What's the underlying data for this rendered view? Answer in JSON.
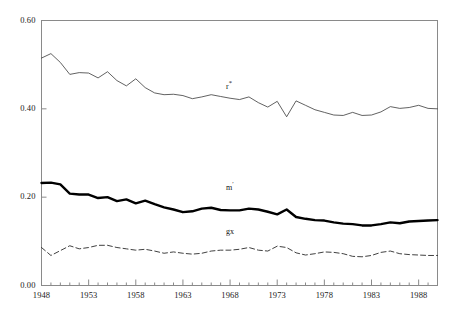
{
  "chart_data": {
    "type": "line",
    "title": "",
    "subtitle": "",
    "xlabel": "",
    "ylabel": "",
    "xlim": [
      1948,
      1990
    ],
    "ylim": [
      0.0,
      0.6
    ],
    "grid": false,
    "legend_position": "inline-annotations",
    "y_ticks": [
      "0.00",
      "0.20",
      "0.40",
      "0.60"
    ],
    "y_tick_values": [
      0.0,
      0.2,
      0.4,
      0.6
    ],
    "x_ticks": [
      "1948",
      "1953",
      "1958",
      "1963",
      "1968",
      "1973",
      "1978",
      "1983",
      "1988"
    ],
    "x_tick_values": [
      1948,
      1953,
      1958,
      1963,
      1968,
      1973,
      1978,
      1983,
      1988
    ],
    "x_minor_tick_interval": 1,
    "x": [
      1948,
      1949,
      1950,
      1951,
      1952,
      1953,
      1954,
      1955,
      1956,
      1957,
      1958,
      1959,
      1960,
      1961,
      1962,
      1963,
      1964,
      1965,
      1966,
      1967,
      1968,
      1969,
      1970,
      1971,
      1972,
      1973,
      1974,
      1975,
      1976,
      1977,
      1978,
      1979,
      1980,
      1981,
      1982,
      1983,
      1984,
      1985,
      1986,
      1987,
      1988,
      1989,
      1990
    ],
    "series": [
      {
        "name": "r*",
        "label": "r",
        "label_sup": "*",
        "style": "solid-thin",
        "color": "#3a3a3a",
        "line_width": 0.8,
        "label_x": 1968,
        "label_y": 0.455,
        "values": [
          0.515,
          0.525,
          0.505,
          0.478,
          0.482,
          0.481,
          0.47,
          0.484,
          0.464,
          0.452,
          0.468,
          0.448,
          0.436,
          0.432,
          0.433,
          0.43,
          0.423,
          0.427,
          0.432,
          0.428,
          0.424,
          0.421,
          0.427,
          0.414,
          0.404,
          0.417,
          0.382,
          0.418,
          0.408,
          0.398,
          0.392,
          0.386,
          0.385,
          0.392,
          0.385,
          0.386,
          0.393,
          0.405,
          0.401,
          0.403,
          0.408,
          0.401,
          0.4
        ]
      },
      {
        "name": "m'",
        "label": "m",
        "label_sup": "′",
        "style": "solid-bold",
        "color": "#000000",
        "line_width": 2.4,
        "label_x": 1968,
        "label_y": 0.225,
        "values": [
          0.232,
          0.233,
          0.229,
          0.208,
          0.206,
          0.206,
          0.198,
          0.2,
          0.191,
          0.195,
          0.186,
          0.192,
          0.184,
          0.177,
          0.172,
          0.166,
          0.168,
          0.174,
          0.176,
          0.171,
          0.17,
          0.17,
          0.174,
          0.172,
          0.167,
          0.161,
          0.172,
          0.155,
          0.151,
          0.148,
          0.147,
          0.143,
          0.14,
          0.139,
          0.136,
          0.136,
          0.139,
          0.143,
          0.141,
          0.145,
          0.146,
          0.147,
          0.148
        ]
      },
      {
        "name": "gx",
        "label": "gx",
        "label_sup": "",
        "style": "dashed",
        "color": "#2a2a2a",
        "line_width": 0.9,
        "label_x": 1968,
        "label_y": 0.118,
        "values": [
          0.086,
          0.068,
          0.079,
          0.09,
          0.083,
          0.086,
          0.091,
          0.091,
          0.086,
          0.083,
          0.08,
          0.082,
          0.078,
          0.073,
          0.076,
          0.073,
          0.071,
          0.073,
          0.078,
          0.08,
          0.08,
          0.082,
          0.086,
          0.08,
          0.078,
          0.089,
          0.086,
          0.074,
          0.069,
          0.072,
          0.076,
          0.075,
          0.072,
          0.066,
          0.065,
          0.068,
          0.075,
          0.078,
          0.072,
          0.07,
          0.069,
          0.068,
          0.068
        ]
      }
    ]
  },
  "axes": {
    "frame_color": "#7a7a7a"
  }
}
